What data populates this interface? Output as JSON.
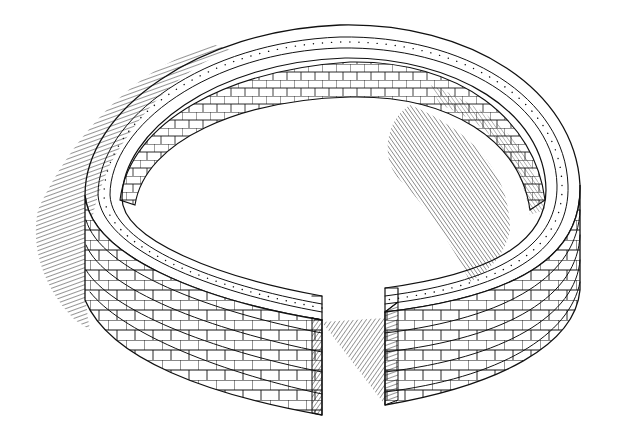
{
  "illustration": {
    "subject": "circular brick wall with a gap, pen-and-ink drawing",
    "colors": {
      "background": "#ffffff",
      "ink": "#111111"
    }
  }
}
